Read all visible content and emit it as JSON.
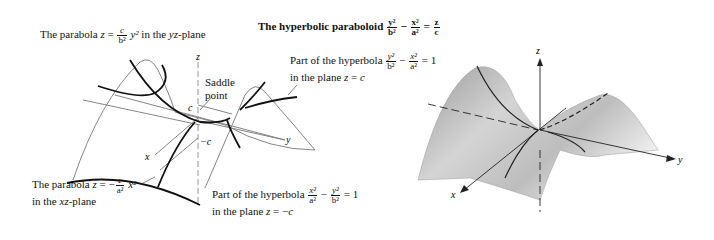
{
  "title": {
    "prefix": "The hyperbolic paraboloid",
    "eq": {
      "t1_num": "y²",
      "t1_den": "b²",
      "op1": "−",
      "t2_num": "x²",
      "t2_den": "a²",
      "op2": "=",
      "t3_num": "z",
      "t3_den": "c"
    }
  },
  "left_diagram": {
    "labels": {
      "parabola_yz": {
        "text_a": "The parabola ",
        "var": "z",
        "eq": " = ",
        "num": "c",
        "den": "b²",
        "tail_var": " y²",
        "tail": " in the ",
        "plane": "yz",
        "plane_suffix": "-plane"
      },
      "hyperbola_top": {
        "line1_a": "Part of the hyperbola ",
        "n1": "y²",
        "d1": "b²",
        "op": " − ",
        "n2": "x²",
        "d2": "a²",
        "rhs": " = 1",
        "line2_a": "in the plane ",
        "line2_var": "z",
        "line2_b": " = ",
        "line2_c": "c"
      },
      "saddle": {
        "line1": "Saddle",
        "line2": "point"
      },
      "parabola_xz": {
        "text_a": "The parabola ",
        "var": "z",
        "eq": " = −",
        "num": "c",
        "den": "a²",
        "tail_var": " x²",
        "line2_a": "in the ",
        "plane": "xz",
        "plane_suffix": "-plane"
      },
      "hyperbola_bottom": {
        "line1_a": "Part of the hyperbola ",
        "n1": "x²",
        "d1": "a²",
        "op": " − ",
        "n2": "y²",
        "d2": "b²",
        "rhs": " = 1",
        "line2_a": "in the plane ",
        "line2_var": "z",
        "line2_b": " = −",
        "line2_c": "c"
      }
    },
    "axes": {
      "z": "z",
      "x": "x",
      "y": "y",
      "c": "c",
      "neg_c": "−c"
    }
  },
  "right_diagram": {
    "axes": {
      "z": "z",
      "x": "x",
      "y": "y"
    }
  }
}
